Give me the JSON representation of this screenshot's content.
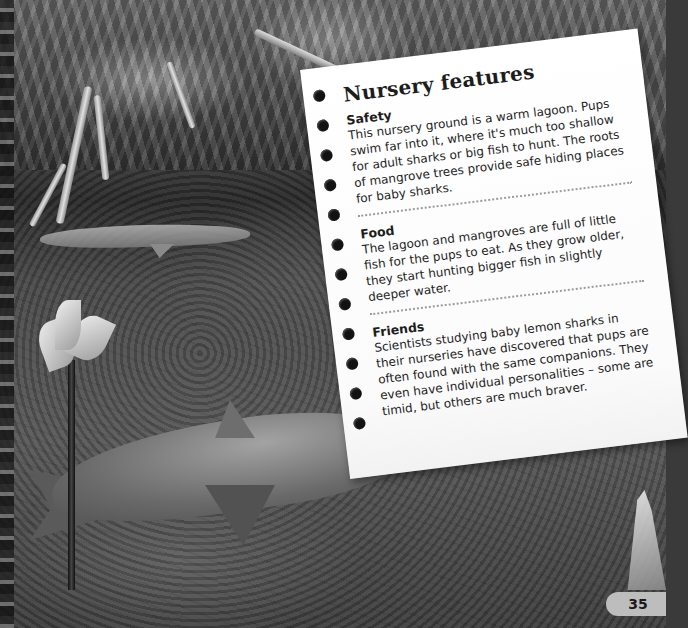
{
  "page": {
    "number": "35"
  },
  "note_card": {
    "title": "Nursery features",
    "sections": [
      {
        "heading": "Safety",
        "text": "This nursery ground is a warm lagoon. Pups swim far into it, where it's much too shallow for adult sharks or big fish to hunt. The roots of mangrove trees provide safe hiding places for baby sharks."
      },
      {
        "heading": "Food",
        "text": "The lagoon and mangroves are full of little fish for the pups to eat. As they grow older, they start hunting bigger fish in slightly deeper water."
      },
      {
        "heading": "Friends",
        "text": "Scientists studying baby lemon sharks in their nurseries have discovered that pups are often found with the same companions. They even have individual personalities – some are timid, but others are much braver."
      }
    ]
  },
  "photo": {
    "subject": "lemon shark pups in mangrove lagoon",
    "style": "grayscale"
  }
}
